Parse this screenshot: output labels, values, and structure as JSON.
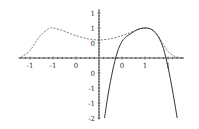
{
  "chart_data": {
    "type": "line",
    "title": "",
    "xlabel": "",
    "ylabel": "",
    "xlim": [
      -1.75,
      1.85
    ],
    "ylim": [
      -2,
      1.6
    ],
    "grid": false,
    "legend": null,
    "x_ticks": [
      -1.5,
      -1,
      -0.5,
      0.5,
      1,
      1.5
    ],
    "x_tick_labels": [
      "-1",
      "-1",
      "0",
      "0",
      "1",
      "1"
    ],
    "y_ticks": [
      1.5,
      1,
      0.5,
      -0.5,
      -1,
      -1.5,
      -2
    ],
    "y_tick_labels": [
      "1",
      "1",
      "0",
      "0",
      "-1",
      "-1",
      "-2"
    ],
    "series": [
      {
        "name": "function",
        "style": "dashed",
        "color": "#555555",
        "x": [
          -1.7,
          -1.5,
          -1.3,
          -1.1,
          -1.0,
          -0.8,
          -0.6,
          -0.4,
          -0.2,
          0.0,
          0.2,
          0.4,
          0.6,
          0.8,
          1.0,
          1.2,
          1.4,
          1.5,
          1.6,
          1.7,
          1.8
        ],
        "y": [
          0.02,
          0.25,
          0.7,
          0.97,
          1.0,
          0.92,
          0.8,
          0.7,
          0.63,
          0.6,
          0.63,
          0.7,
          0.8,
          0.92,
          1.0,
          0.9,
          0.45,
          0.22,
          0.09,
          0.03,
          0.01
        ]
      },
      {
        "name": "approximation",
        "style": "solid",
        "color": "#333333",
        "x": [
          0.12,
          0.2,
          0.3,
          0.4,
          0.5,
          0.6,
          0.7,
          0.8,
          0.9,
          1.0,
          1.1,
          1.2,
          1.3,
          1.4,
          1.5,
          1.6,
          1.7
        ],
        "y": [
          -2.0,
          -1.2,
          -0.4,
          0.2,
          0.55,
          0.72,
          0.82,
          0.92,
          0.98,
          1.0,
          0.98,
          0.88,
          0.68,
          0.32,
          -0.3,
          -1.1,
          -2.0
        ]
      }
    ]
  }
}
